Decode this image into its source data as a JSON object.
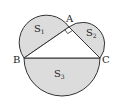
{
  "diagram": {
    "type": "geometry",
    "points": {
      "A": {
        "label": "A",
        "x": 69,
        "y": 27
      },
      "B": {
        "label": "B",
        "x": 24,
        "y": 58
      },
      "C": {
        "label": "C",
        "x": 100,
        "y": 58
      }
    },
    "regions": {
      "S1": {
        "label": "S",
        "sub": "1"
      },
      "S2": {
        "label": "S",
        "sub": "2"
      },
      "S3": {
        "label": "S",
        "sub": "3"
      }
    },
    "colors": {
      "fill": "#dcdcdc",
      "stroke": "#333333",
      "background": "#ffffff"
    }
  }
}
